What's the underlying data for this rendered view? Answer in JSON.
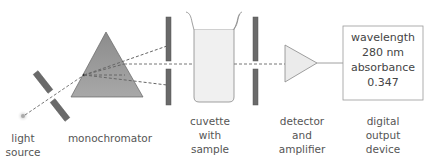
{
  "components": {
    "light_source": {
      "label_line1": "light",
      "label_line2": "source"
    },
    "monochromator": {
      "label": "monochromator"
    },
    "cuvette": {
      "label_line1": "cuvette",
      "label_line2": "with",
      "label_line3": "sample"
    },
    "detector": {
      "label_line1": "detector",
      "label_line2": "and",
      "label_line3": "amplifier"
    },
    "output": {
      "label_line1": "digital",
      "label_line2": "output",
      "label_line3": "device"
    }
  },
  "display": {
    "line1": "wavelength",
    "line2": "280 nm",
    "line3": "absorbance",
    "line4": "0.347"
  },
  "colors": {
    "slit": "#6a6a6a",
    "prism": "#8a8a8a",
    "beam": "#777777",
    "cuvette_liquid": "#eeeeee",
    "outline": "#888888"
  }
}
